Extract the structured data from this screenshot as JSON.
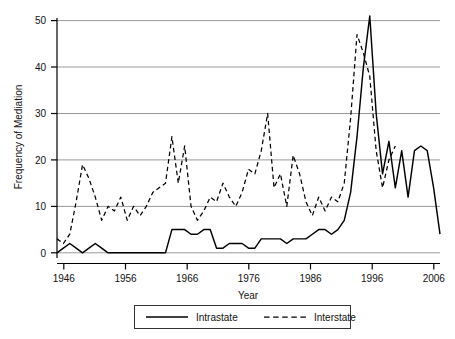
{
  "chart_data": {
    "type": "line",
    "title": "",
    "xlabel": "Year",
    "ylabel": "Frequency of Mediation",
    "xlim": [
      1946,
      2006
    ],
    "ylim": [
      0,
      52
    ],
    "xticks": [
      1946,
      1956,
      1966,
      1976,
      1986,
      1996,
      2006
    ],
    "yticks": [
      0,
      10,
      20,
      30,
      40,
      50
    ],
    "grid": "horizontal",
    "legend_position": "bottom-center",
    "x": [
      1946,
      1947,
      1948,
      1949,
      1950,
      1951,
      1952,
      1953,
      1954,
      1955,
      1956,
      1957,
      1958,
      1959,
      1960,
      1961,
      1962,
      1963,
      1964,
      1965,
      1966,
      1967,
      1968,
      1969,
      1970,
      1971,
      1972,
      1973,
      1974,
      1975,
      1976,
      1977,
      1978,
      1979,
      1980,
      1981,
      1982,
      1983,
      1984,
      1985,
      1986,
      1987,
      1988,
      1989,
      1990,
      1991,
      1992,
      1993,
      1994,
      1995,
      1996,
      1997,
      1998,
      1999,
      2000,
      2001,
      2002,
      2003,
      2004,
      2005,
      2006
    ],
    "series": [
      {
        "name": "Intrastate",
        "style": "solid",
        "color": "#000000",
        "values": [
          0,
          1,
          2,
          1,
          0,
          1,
          2,
          1,
          0,
          0,
          0,
          0,
          0,
          0,
          0,
          0,
          0,
          0,
          5,
          5,
          5,
          4,
          4,
          5,
          5,
          1,
          1,
          2,
          2,
          2,
          1,
          1,
          3,
          3,
          3,
          3,
          2,
          3,
          3,
          3,
          4,
          5,
          5,
          4,
          5,
          7,
          13,
          25,
          40,
          51,
          30,
          17,
          24,
          14,
          22,
          12,
          22,
          23,
          22,
          14,
          4
        ]
      },
      {
        "name": "Interstate",
        "style": "dashed",
        "color": "#000000",
        "values": [
          3,
          2,
          4,
          11,
          19,
          16,
          12,
          7,
          10,
          9,
          12,
          7,
          10,
          8,
          10,
          13,
          14,
          15,
          25,
          15,
          23,
          10,
          7,
          9,
          12,
          11,
          15,
          12,
          10,
          13,
          18,
          17,
          22,
          30,
          14,
          17,
          10,
          21,
          17,
          11,
          8,
          12,
          9,
          12,
          11,
          15,
          29,
          47,
          43,
          38,
          22,
          14,
          20,
          23,
          null,
          null,
          null,
          null,
          null,
          null,
          null
        ]
      }
    ]
  },
  "legend": {
    "entries": [
      {
        "label": "Intrastate",
        "style": "solid"
      },
      {
        "label": "Interstate",
        "style": "dashed"
      }
    ]
  },
  "axes": {
    "y_title": "Frequency of Mediation",
    "x_title": "Year",
    "x_tick_labels": [
      "1946",
      "1956",
      "1966",
      "1976",
      "1986",
      "1996",
      "2006"
    ],
    "y_tick_labels": [
      "0",
      "10",
      "20",
      "30",
      "40",
      "50"
    ]
  },
  "colors": {
    "line": "#000000",
    "grid": "#9a9a9a",
    "axis": "#000000",
    "background": "#ffffff"
  }
}
